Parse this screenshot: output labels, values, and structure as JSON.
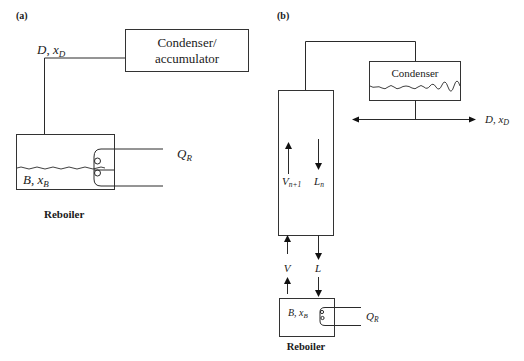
{
  "panel_a": {
    "label": "(a)",
    "condenser_line1": "Condenser/",
    "condenser_line2": "accumulator",
    "distillate_D": "D",
    "distillate_sep": ", ",
    "distillate_x": "x",
    "distillate_sub": "D",
    "bottoms_B": "B",
    "bottoms_sep": ", ",
    "bottoms_x": "x",
    "bottoms_sub": "B",
    "heat_Q": "Q",
    "heat_sub": "R",
    "reboiler_caption": "Reboiler"
  },
  "panel_b": {
    "label": "(b)",
    "condenser": "Condenser",
    "distillate_D": "D",
    "distillate_sep": ", ",
    "distillate_x": "x",
    "distillate_sub": "D",
    "vapor_up": "V",
    "vapor_up_sub": "n+1",
    "liquid_down": "L",
    "liquid_down_sub": "n",
    "vapor": "V",
    "liquid": "L",
    "bottoms_B": "B",
    "bottoms_sep": ", ",
    "bottoms_x": "x",
    "bottoms_sub": "B",
    "heat_Q": "Q",
    "heat_sub": "R",
    "reboiler_caption": "Reboiler"
  },
  "colors": {
    "line": "#2a2a2a",
    "text": "#1a1a1a",
    "background": "#ffffff"
  }
}
